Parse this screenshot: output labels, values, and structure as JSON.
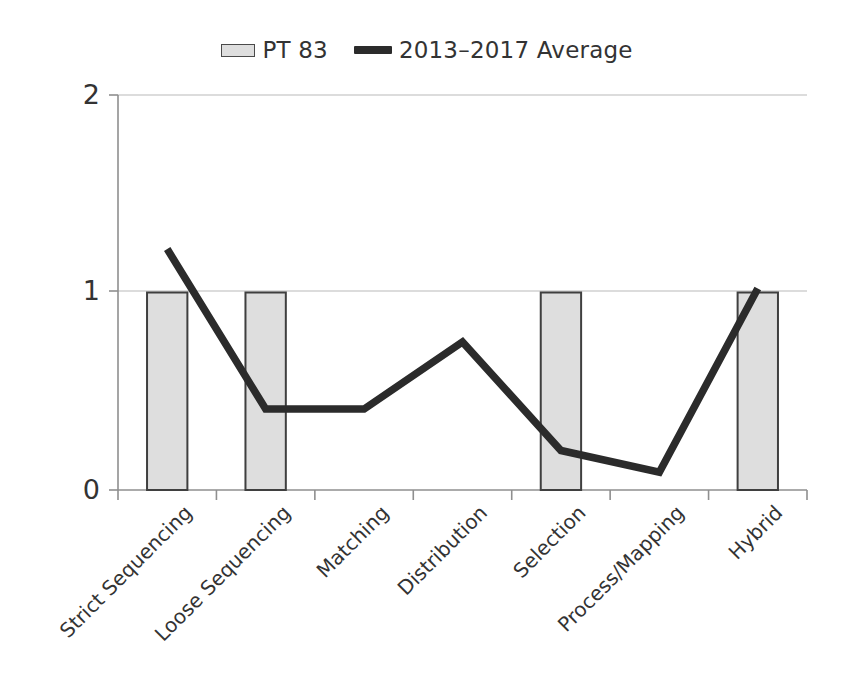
{
  "legend": {
    "position": "top-center",
    "entries": [
      {
        "label": "PT 83",
        "marker": "bar-swatch-icon",
        "color": "#dedede"
      },
      {
        "label": "2013–2017 Average",
        "marker": "line-swatch-icon",
        "color": "#2b2b2b"
      }
    ]
  },
  "axes": {
    "y_ticks": [
      "0",
      "1",
      "2"
    ],
    "x_labels": [
      "Strict Sequencing",
      "Loose Sequencing",
      "Matching",
      "Distribution",
      "Selection",
      "Process/Mapping",
      "Hybrid"
    ]
  },
  "chart_data": {
    "type": "bar",
    "title": "",
    "subtitle": "",
    "xlabel": "",
    "ylabel": "",
    "ylim": [
      0,
      2
    ],
    "yticks": [
      0,
      1,
      2
    ],
    "grid": true,
    "legend_position": "top-center",
    "categories": [
      "Strict Sequencing",
      "Loose Sequencing",
      "Matching",
      "Distribution",
      "Selection",
      "Process/Mapping",
      "Hybrid"
    ],
    "series": [
      {
        "name": "PT 83",
        "type": "bar",
        "color": "#dedede",
        "edge_color": "#3f3f3f",
        "values": [
          1,
          1,
          0,
          0,
          1,
          0,
          1
        ]
      },
      {
        "name": "2013–2017 Average",
        "type": "line",
        "color": "#2b2b2b",
        "values": [
          1.22,
          0.41,
          0.41,
          0.75,
          0.2,
          0.09,
          1.02
        ]
      }
    ]
  }
}
